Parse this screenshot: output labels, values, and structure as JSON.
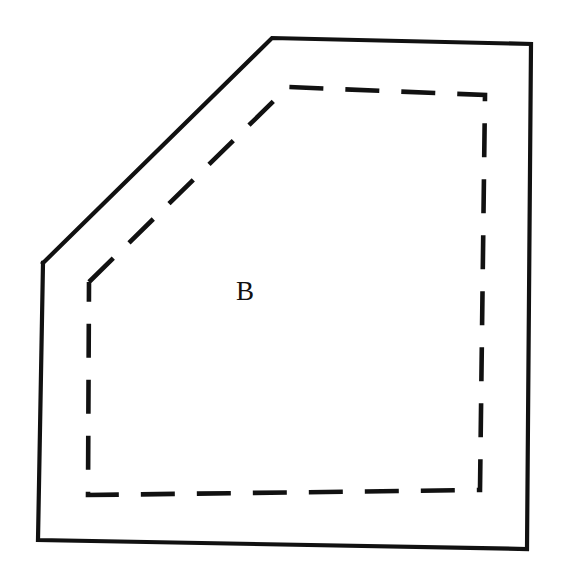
{
  "figure": {
    "kind": "line-drawing",
    "background_color": "#ffffff",
    "ink_color": "#111111",
    "width": 562,
    "height": 572
  },
  "labels": [
    {
      "name": "region-label-b",
      "text": "B",
      "x": 236,
      "y": 300,
      "font_size": 27
    }
  ],
  "shapes": {
    "outer_boundary": {
      "name": "outer-solid-polygon",
      "style": "solid",
      "stroke_width": 4.2,
      "color": "#111111",
      "points": "43,263 272,38 531,44 527,549 38,540 43,263",
      "vertices": [
        {
          "label": "left-bend",
          "x": 43,
          "y": 263
        },
        {
          "label": "top-left-apex",
          "x": 272,
          "y": 38
        },
        {
          "label": "top-right",
          "x": 531,
          "y": 44
        },
        {
          "label": "bottom-right",
          "x": 527,
          "y": 549
        },
        {
          "label": "bottom-left",
          "x": 38,
          "y": 540
        }
      ]
    },
    "inner_boundary": {
      "name": "inner-dashed-polygon",
      "style": "dashed",
      "stroke_width": 4.6,
      "color": "#111111",
      "dash_pattern": "34 22",
      "points": "89,282 288,87 485,95 480,490 88,495 89,282",
      "vertices": [
        {
          "label": "left-bend",
          "x": 89,
          "y": 282
        },
        {
          "label": "top-left-apex",
          "x": 288,
          "y": 87
        },
        {
          "label": "top-right",
          "x": 485,
          "y": 95
        },
        {
          "label": "bottom-right",
          "x": 480,
          "y": 490
        },
        {
          "label": "bottom-left",
          "x": 88,
          "y": 495
        }
      ]
    }
  },
  "segments": [
    {
      "name": "outer-edge-diagonal-upper-left",
      "style": "solid",
      "from": [
        43,
        263
      ],
      "to": [
        272,
        38
      ]
    },
    {
      "name": "outer-edge-top",
      "style": "solid",
      "from": [
        272,
        38
      ],
      "to": [
        531,
        44
      ]
    },
    {
      "name": "outer-edge-right",
      "style": "solid",
      "from": [
        531,
        44
      ],
      "to": [
        527,
        549
      ]
    },
    {
      "name": "outer-edge-bottom",
      "style": "solid",
      "from": [
        527,
        549
      ],
      "to": [
        38,
        540
      ]
    },
    {
      "name": "outer-edge-left",
      "style": "solid",
      "from": [
        38,
        540
      ],
      "to": [
        43,
        263
      ]
    },
    {
      "name": "inner-edge-diagonal-upper-left",
      "style": "dashed",
      "from": [
        89,
        282
      ],
      "to": [
        288,
        87
      ]
    },
    {
      "name": "inner-edge-top",
      "style": "dashed",
      "from": [
        288,
        87
      ],
      "to": [
        485,
        95
      ]
    },
    {
      "name": "inner-edge-right",
      "style": "dashed",
      "from": [
        485,
        95
      ],
      "to": [
        480,
        490
      ]
    },
    {
      "name": "inner-edge-bottom",
      "style": "dashed",
      "from": [
        480,
        490
      ],
      "to": [
        88,
        495
      ]
    },
    {
      "name": "inner-edge-left",
      "style": "dashed",
      "from": [
        88,
        495
      ],
      "to": [
        89,
        282
      ]
    }
  ]
}
